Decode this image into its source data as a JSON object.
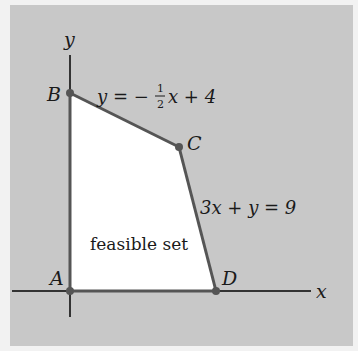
{
  "diagram": {
    "type": "linear-programming-feasible-region",
    "axes": {
      "x_label": "x",
      "y_label": "y"
    },
    "vertices": [
      {
        "name": "A",
        "label": "A"
      },
      {
        "name": "B",
        "label": "B"
      },
      {
        "name": "C",
        "label": "C"
      },
      {
        "name": "D",
        "label": "D"
      }
    ],
    "constraints": [
      {
        "label": "y = −½x + 4",
        "lhs": "y = −",
        "frac_num": "1",
        "frac_den": "2",
        "rhs": "x + 4"
      },
      {
        "label": "3x + y = 9"
      }
    ],
    "region_label": "feasible set",
    "colors": {
      "background": "#c8c8c8",
      "region": "#ffffff",
      "edge": "#555555",
      "axis": "#333333"
    }
  }
}
